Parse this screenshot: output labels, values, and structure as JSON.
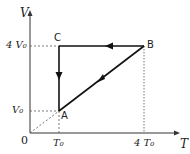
{
  "diagram": {
    "type": "V-T graph, cyclic process",
    "axes": {
      "y_label": "V",
      "x_label": "T",
      "origin_label": "0"
    },
    "y_ticks": [
      "4 V₀",
      "V₀"
    ],
    "x_ticks": [
      "T₀",
      "4 T₀"
    ],
    "points": [
      {
        "name": "A",
        "T": "T₀",
        "V": "V₀"
      },
      {
        "name": "B",
        "T": "4 T₀",
        "V": "4 V₀"
      },
      {
        "name": "C",
        "T": "T₀",
        "V": "4 V₀"
      }
    ],
    "process": [
      "A → B (line through origin)",
      "B → C (constant V)",
      "C → A (constant T)"
    ]
  }
}
